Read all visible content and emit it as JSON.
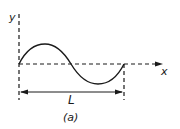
{
  "figure": {
    "caption": "(a)",
    "axes": {
      "y_label": "y",
      "x_label": "x"
    },
    "dimension": {
      "label": "L",
      "description": "one full wavelength"
    },
    "curve": {
      "type": "sine",
      "periods": 1,
      "start_phase": "zero, rising"
    },
    "colors": {
      "ink": "#1a1a1a",
      "background": "#ffffff"
    }
  }
}
